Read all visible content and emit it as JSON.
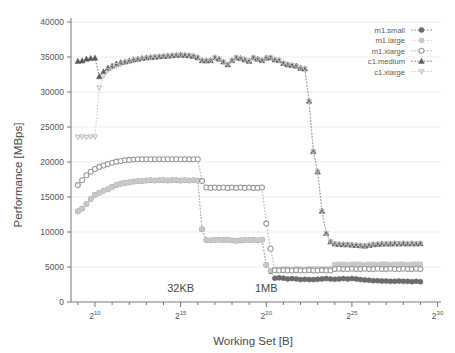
{
  "chart_data": {
    "type": "scatter",
    "title": "",
    "xlabel": "Working Set [B]",
    "ylabel": "Performance [MBps]",
    "xscale": "log2",
    "xlim": [
      256,
      1073741824
    ],
    "ylim": [
      0,
      40000
    ],
    "grid": true,
    "legend_position": "top-right",
    "y_ticks": [
      0,
      5000,
      10000,
      15000,
      20000,
      25000,
      30000,
      35000,
      40000
    ],
    "y_tick_labels": [
      "0",
      "5000",
      "10000",
      "15000",
      "20000",
      "25000",
      "30000",
      "35000",
      "40000"
    ],
    "x_ticks_exponents": [
      10,
      15,
      20,
      25,
      30
    ],
    "x_tick_labels": [
      "2^10",
      "2^15",
      "2^20",
      "2^25",
      "2^30"
    ],
    "x_tick_base": "2",
    "x_tick_exponent_labels": [
      "10",
      "15",
      "20",
      "25",
      "30"
    ],
    "annotations": [
      {
        "text": "32KB",
        "x_exponent": 15.0,
        "y": 1500
      },
      {
        "text": "1MB",
        "x_exponent": 20.0,
        "y": 1500
      }
    ],
    "x_exponents": [
      9.0,
      9.25,
      9.5,
      9.75,
      10.0,
      10.25,
      10.5,
      10.75,
      11.0,
      11.25,
      11.5,
      11.75,
      12.0,
      12.25,
      12.5,
      12.75,
      13.0,
      13.25,
      13.5,
      13.75,
      14.0,
      14.25,
      14.5,
      14.75,
      15.0,
      15.25,
      15.5,
      15.75,
      16.0,
      16.25,
      16.5,
      16.75,
      17.0,
      17.25,
      17.5,
      17.75,
      18.0,
      18.25,
      18.5,
      18.75,
      19.0,
      19.25,
      19.5,
      19.75,
      20.0,
      20.25,
      20.5,
      20.75,
      21.0,
      21.25,
      21.5,
      21.75,
      22.0,
      22.25,
      22.5,
      22.75,
      23.0,
      23.25,
      23.5,
      23.75,
      24.0,
      24.25,
      24.5,
      24.75,
      25.0,
      25.25,
      25.5,
      25.75,
      26.0,
      26.25,
      26.5,
      26.75,
      27.0,
      27.25,
      27.5,
      27.75,
      28.0,
      28.25,
      28.5,
      28.75,
      29.0
    ],
    "series": [
      {
        "name": "m1.small",
        "color": "#6b6b6b",
        "marker": "circle-filled",
        "values": [
          12950,
          13350,
          14000,
          14700,
          15300,
          15600,
          15900,
          16100,
          16450,
          16700,
          16900,
          17000,
          17100,
          17200,
          17250,
          17300,
          17350,
          17400,
          17350,
          17400,
          17400,
          17350,
          17400,
          17400,
          17350,
          17400,
          17350,
          17400,
          17350,
          10400,
          8850,
          8800,
          8850,
          8900,
          8850,
          8900,
          8800,
          8750,
          8800,
          8850,
          8850,
          8900,
          8800,
          8900,
          5300,
          4400,
          3400,
          3450,
          3400,
          3300,
          3350,
          3300,
          3200,
          3250,
          3200,
          3200,
          3250,
          3300,
          3350,
          3300,
          3250,
          3300,
          3350,
          3300,
          3350,
          3300,
          3200,
          3150,
          3100,
          3050,
          3050,
          3000,
          3000,
          2950,
          2950,
          3000,
          2950,
          2950,
          2900,
          2950,
          2900
        ]
      },
      {
        "name": "m1.large",
        "color": "#c8c8c8",
        "marker": "square",
        "values": [
          12950,
          13350,
          14000,
          14700,
          15300,
          15600,
          15900,
          16100,
          16450,
          16700,
          16900,
          17000,
          17100,
          17200,
          17250,
          17300,
          17350,
          17400,
          17350,
          17400,
          17400,
          17350,
          17400,
          17400,
          17350,
          17400,
          17350,
          17400,
          17350,
          10400,
          8850,
          8800,
          8850,
          8900,
          8850,
          8900,
          8800,
          8750,
          8800,
          8850,
          8850,
          8900,
          8800,
          8900,
          5300,
          4500,
          4600,
          4650,
          4700,
          4700,
          4650,
          4700,
          4700,
          4650,
          4700,
          4700,
          4700,
          4700,
          4700,
          4750,
          5350,
          5400,
          5400,
          5350,
          5400,
          5400,
          5400,
          5350,
          5400,
          5400,
          5350,
          5400,
          5400,
          5350,
          5400,
          5400,
          5400,
          5350,
          5400,
          5400,
          5400
        ]
      },
      {
        "name": "m1.xlarge",
        "color": "#9a9a9a",
        "marker": "circle-open",
        "values": [
          16700,
          17400,
          18100,
          18600,
          19000,
          19300,
          19500,
          19700,
          19900,
          20050,
          20150,
          20250,
          20300,
          20350,
          20400,
          20400,
          20400,
          20400,
          20400,
          20400,
          20400,
          20400,
          20400,
          20400,
          20400,
          20400,
          20400,
          20400,
          20400,
          17300,
          16350,
          16300,
          16350,
          16300,
          16350,
          16300,
          16350,
          16300,
          16350,
          16300,
          16350,
          16300,
          16300,
          16350,
          11200,
          7600,
          4550,
          4500,
          4550,
          4500,
          4500,
          4550,
          4500,
          4500,
          4550,
          4500,
          4500,
          4550,
          4500,
          4500,
          4700,
          4750,
          4700,
          4700,
          4750,
          4700,
          4700,
          4750,
          4700,
          4700,
          4750,
          4700,
          4700,
          4750,
          4700,
          4700,
          4750,
          4700,
          4700,
          4750,
          4700
        ]
      },
      {
        "name": "c1.medium",
        "color": "#5a5a5a",
        "marker": "triangle-filled",
        "values": [
          34400,
          34450,
          34700,
          34800,
          34850,
          32200,
          32900,
          33400,
          33700,
          34000,
          34200,
          34300,
          34450,
          34600,
          34700,
          34800,
          34900,
          34950,
          35000,
          35050,
          35100,
          35150,
          35200,
          35250,
          35300,
          35250,
          35200,
          35100,
          34900,
          34500,
          34450,
          34500,
          34900,
          34700,
          34300,
          33900,
          34500,
          34900,
          34800,
          34600,
          34400,
          34900,
          34700,
          34500,
          34850,
          34900,
          34600,
          34500,
          34100,
          33900,
          33800,
          33700,
          33400,
          33300,
          28700,
          21500,
          18600,
          13000,
          9800,
          8600,
          8300,
          8250,
          8200,
          8200,
          8150,
          8100,
          8050,
          8000,
          8100,
          8200,
          8250,
          8300,
          8300,
          8300,
          8350,
          8300,
          8350,
          8300,
          8350,
          8300,
          8350
        ]
      },
      {
        "name": "c1.xlarge",
        "color": "#bdbdbd",
        "marker": "triangle-down",
        "values": [
          23550,
          23600,
          23550,
          23600,
          23600,
          30600,
          32300,
          33100,
          33500,
          33800,
          34000,
          34200,
          34350,
          34500,
          34650,
          34750,
          34850,
          34900,
          35000,
          35050,
          35100,
          35150,
          35200,
          35250,
          35300,
          35250,
          35200,
          35100,
          34900,
          34500,
          34450,
          34500,
          34900,
          34700,
          34300,
          33900,
          34500,
          34900,
          34800,
          34600,
          34400,
          34900,
          34700,
          34500,
          34850,
          34900,
          34600,
          34500,
          34100,
          33900,
          33800,
          33700,
          33400,
          33300,
          28700,
          21500,
          18600,
          13000,
          9800,
          8600,
          8300,
          8250,
          8200,
          8200,
          8150,
          8100,
          8050,
          8000,
          8100,
          8200,
          8250,
          8300,
          8300,
          8300,
          8350,
          8300,
          8350,
          8300,
          8350,
          8300,
          8350
        ]
      }
    ]
  },
  "legend": {
    "items": [
      {
        "label": "m1.small"
      },
      {
        "label": "m1.large"
      },
      {
        "label": "m1.xlarge"
      },
      {
        "label": "c1.medium"
      },
      {
        "label": "c1.xlarge"
      }
    ]
  },
  "axes": {
    "y_title": "Performance [MBps]",
    "x_title": "Working Set [B]"
  }
}
